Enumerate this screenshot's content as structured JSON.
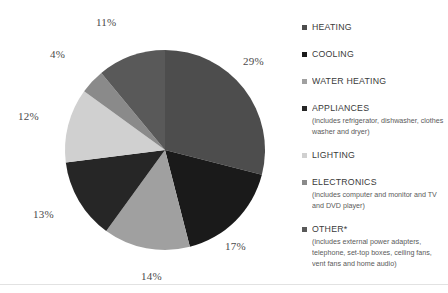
{
  "chart_data": {
    "type": "pie",
    "title": "",
    "subtitle": "",
    "xlabel": "",
    "ylabel": "",
    "legend_position": "right",
    "grid": false,
    "start_angle_deg": 0,
    "direction": "clockwise",
    "categories": [
      "HEATING",
      "COOLING",
      "WATER HEATING",
      "APPLIANCES",
      "LIGHTING",
      "ELECTRONICS",
      "OTHER*"
    ],
    "values": [
      29,
      17,
      14,
      13,
      12,
      4,
      11
    ],
    "value_unit": "%",
    "colors": [
      "#4d4d4d",
      "#1a1a1a",
      "#a0a0a0",
      "#262626",
      "#d0d0d0",
      "#8a8a8a",
      "#595959"
    ],
    "data_labels": [
      "29%",
      "17%",
      "14%",
      "13%",
      "12%",
      "4%",
      "11%"
    ],
    "annotations": [
      "(includes refrigerator, dishwasher, clothes washer and dryer)",
      "(includes computer and monitor and TV and DVD player)",
      "(includes external power adapters, telephone, set-top boxes, ceiling fans, vent fans and home audio)"
    ]
  },
  "pie": {
    "labels": [
      {
        "text": "29%",
        "left": 243,
        "top": 55
      },
      {
        "text": "17%",
        "left": 225,
        "top": 240
      },
      {
        "text": "14%",
        "left": 141,
        "top": 270
      },
      {
        "text": "13%",
        "left": 33,
        "top": 208
      },
      {
        "text": "12%",
        "left": 18,
        "top": 110
      },
      {
        "text": "4%",
        "left": 50,
        "top": 48
      },
      {
        "text": "11%",
        "left": 96,
        "top": 16
      }
    ]
  },
  "legend": {
    "items": [
      {
        "label": "HEATING",
        "color": "#4d4d4d",
        "sub": "",
        "top": 0
      },
      {
        "label": "COOLING",
        "color": "#1a1a1a",
        "sub": "",
        "top": 27
      },
      {
        "label": "WATER HEATING",
        "color": "#a0a0a0",
        "sub": "",
        "top": 54
      },
      {
        "label": "APPLIANCES",
        "color": "#262626",
        "sub": "(includes refrigerator, dishwasher, clothes washer and dryer)",
        "top": 81
      },
      {
        "label": "LIGHTING",
        "color": "#d0d0d0",
        "sub": "",
        "top": 128
      },
      {
        "label": "ELECTRONICS",
        "color": "#8a8a8a",
        "sub": "(includes computer and monitor and TV and DVD player)",
        "top": 155
      },
      {
        "label": "OTHER*",
        "color": "#595959",
        "sub": "(includes external power adapters, telephone, set-top boxes, ceiling fans, vent fans and home audio)",
        "top": 202
      }
    ]
  }
}
